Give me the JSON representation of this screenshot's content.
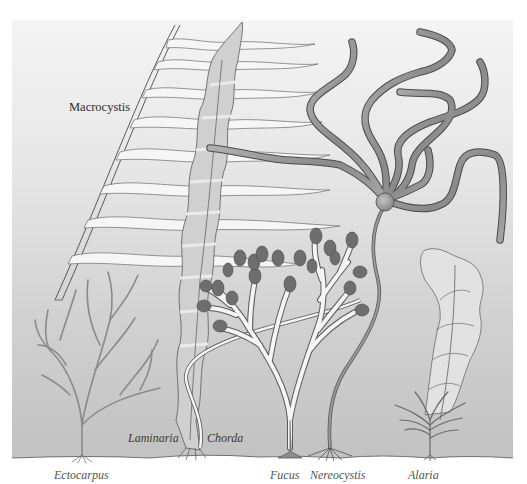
{
  "figure": {
    "background": {
      "top_color": "#f3f3f3",
      "bottom_color": "#c4c4c4",
      "page_color": "#ffffff"
    },
    "colors": {
      "outline": "#4a4a4a",
      "pale_frond": "#f4f4f4",
      "laminaria_fill": "#d2d2d2",
      "nereocystis_fill": "#9a9a9a",
      "receptacle_fill": "#6e6e6e",
      "ectocarpus_stroke": "#8c8c8c"
    }
  },
  "labels": {
    "macrocystis": "Macrocystis",
    "laminaria": "Laminaria",
    "chorda": "Chorda",
    "ectocarpus": "Ectocarpus",
    "fucus": "Fucus",
    "nereocystis": "Nereocystis",
    "alaria": "Alaria"
  }
}
